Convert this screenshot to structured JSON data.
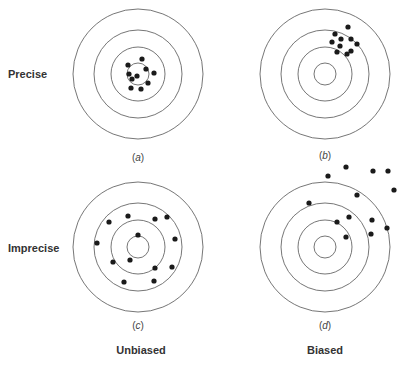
{
  "rows": [
    {
      "label": "Precise",
      "x": 8,
      "y": 74
    },
    {
      "label": "Imprecise",
      "x": 8,
      "y": 248
    }
  ],
  "columns": [
    {
      "label": "Unbiased",
      "x": 141,
      "y": 350
    },
    {
      "label": "Biased",
      "x": 325,
      "y": 350
    }
  ],
  "style": {
    "ring_color": "#666666",
    "dot_color": "#1a1a1a",
    "text_color": "#333333"
  },
  "targets": [
    {
      "id": "a",
      "letter": "a",
      "cx": 138,
      "cy": 74,
      "rings": [
        65,
        44,
        27,
        11
      ],
      "label_y": 157,
      "shots": [
        [
          142,
          59
        ],
        [
          128,
          65
        ],
        [
          146,
          69
        ],
        [
          154,
          73
        ],
        [
          129,
          74
        ],
        [
          137,
          76
        ],
        [
          132,
          79
        ],
        [
          148,
          83
        ],
        [
          131,
          88
        ],
        [
          141,
          89
        ]
      ]
    },
    {
      "id": "b",
      "letter": "b",
      "cx": 325,
      "cy": 74,
      "rings": [
        65,
        44,
        27,
        11
      ],
      "label_y": 155,
      "shots": [
        [
          348,
          27
        ],
        [
          335,
          34
        ],
        [
          332,
          42
        ],
        [
          341,
          39
        ],
        [
          351,
          39
        ],
        [
          357,
          44
        ],
        [
          340,
          46
        ],
        [
          351,
          51
        ],
        [
          337,
          52
        ],
        [
          347,
          54
        ]
      ]
    },
    {
      "id": "c",
      "letter": "c",
      "cx": 138,
      "cy": 247,
      "rings": [
        65,
        44,
        27,
        11
      ],
      "label_y": 325,
      "shots": [
        [
          109,
          222
        ],
        [
          128,
          216
        ],
        [
          155,
          219
        ],
        [
          167,
          217
        ],
        [
          138,
          235
        ],
        [
          175,
          239
        ],
        [
          97,
          243
        ],
        [
          113,
          262
        ],
        [
          130,
          260
        ],
        [
          155,
          268
        ],
        [
          172,
          267
        ],
        [
          124,
          282
        ],
        [
          154,
          281
        ]
      ]
    },
    {
      "id": "d",
      "letter": "d",
      "cx": 325,
      "cy": 247,
      "rings": [
        65,
        44,
        27,
        11
      ],
      "label_y": 325,
      "shots": [
        [
          346,
          167
        ],
        [
          373,
          171
        ],
        [
          388,
          171
        ],
        [
          328,
          176
        ],
        [
          394,
          190
        ],
        [
          357,
          195
        ],
        [
          309,
          203
        ],
        [
          349,
          217
        ],
        [
          372,
          220
        ],
        [
          337,
          222
        ],
        [
          387,
          228
        ],
        [
          371,
          234
        ],
        [
          346,
          237
        ]
      ]
    }
  ]
}
